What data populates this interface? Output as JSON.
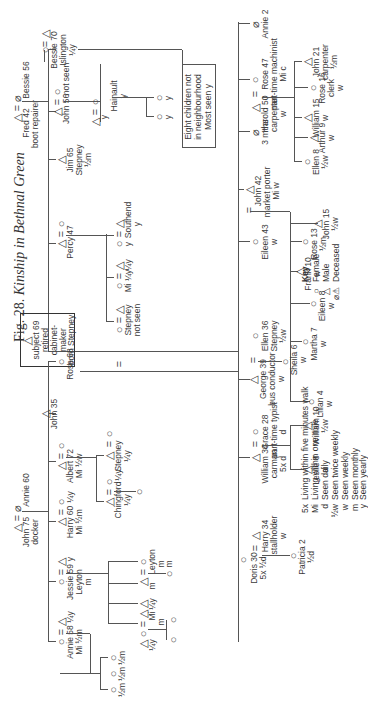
{
  "figure": {
    "label": "Fig. 28.",
    "title": "Kinship in Bethnal Green"
  },
  "symbols": {
    "female": "○",
    "male": "△",
    "deceased_female": "⌀",
    "deceased_male": "⚠",
    "marriage": "="
  },
  "left_family": {
    "parents": {
      "male": "Fred 42",
      "male_note": "boot repairer",
      "female": "Bessie 56"
    },
    "children": [
      {
        "name": "Bessie 70",
        "lines": [
          "Islington",
          "¼y"
        ],
        "sex": "F",
        "spouse": "△"
      },
      {
        "name": "John 56",
        "lines": [
          "not seen"
        ],
        "sex": "M",
        "spouse": "○"
      },
      {
        "name": "Jim 65",
        "lines": [
          "Stepney",
          "½m"
        ],
        "sex": "M"
      },
      {
        "name": "Percy 47",
        "lines": [],
        "sex": "M",
        "spouse": "○"
      }
    ],
    "grandchildren_hainault": {
      "label": "Hainault",
      "freq": "y",
      "kids": [
        "y",
        "y"
      ]
    },
    "note_box": [
      "Eight children not",
      "in neighbourhood",
      "Most seen y"
    ]
  },
  "subject": {
    "lines": [
      "subject 69",
      "retired",
      "cabinet-",
      "maker",
      "born Stepney"
    ]
  },
  "percy_children": [
    {
      "label": "Southend",
      "freq": "y"
    },
    {
      "label": "Mi ¼y",
      "freq": "¼y"
    },
    {
      "label": "Stepney",
      "freq": "not seen"
    }
  ],
  "top_family": {
    "parents": {
      "male": "John 75",
      "male_note": "docker",
      "female": "Annie 60"
    },
    "children": [
      {
        "name": "Rose 68"
      },
      {
        "name": "John 35"
      },
      {
        "name": "Albert 72",
        "lines": [
          "Mi ½w"
        ]
      },
      {
        "name": "Harry 60",
        "lines": [
          "Mi ½m"
        ],
        "spouse_note": "¼y"
      },
      {
        "name": "Jessie 59",
        "lines": [
          "Leyton",
          "m"
        ],
        "spouse_note": "y"
      },
      {
        "name": "Annie 58",
        "lines": [
          "Mi ½m"
        ],
        "spouse_note": "¼y"
      }
    ],
    "albert_children": [
      {
        "label": "Stepney",
        "freq": "¼y"
      },
      {
        "label": "Chingford",
        "freq": "¼y",
        "spouse_note": "¼y"
      }
    ],
    "annie_children": [
      "½m",
      "½m",
      "½m"
    ],
    "jessie_children": [
      {
        "label": "Leyton",
        "freq": "m",
        "child": "m"
      },
      {
        "freq": "¼y"
      },
      {
        "label": "Mi",
        "freq": "m"
      },
      {
        "freq": "¼y"
      }
    ]
  },
  "main_children": [
    {
      "name": "Annie 2",
      "deceased": true
    },
    {
      "name": "Rose 47",
      "lines": [
        "part-time machinist",
        "Mi c"
      ],
      "spouse": "Harold 50",
      "spouse_lines": [
        "carpenter",
        "w"
      ]
    },
    {
      "name": "3 mths",
      "deceased": true
    },
    {
      "name": "John 42",
      "lines": [
        "market porter",
        "Mi w"
      ]
    },
    {
      "name": "Eileen 43",
      "lines": [
        "w"
      ]
    },
    {
      "name": "Ellen 36",
      "lines": [
        "Stepney",
        "½w"
      ]
    },
    {
      "name": "George 39",
      "lines": [
        "bus conductor",
        "w"
      ]
    },
    {
      "name": "Grace 28",
      "lines": [
        "part-time typist",
        "d"
      ],
      "spouse": "William 34",
      "spouse_lines": [
        "carman",
        "5x d"
      ]
    },
    {
      "name": "Harry 34",
      "lines": [
        "stallholder",
        "w"
      ],
      "spouse": "Doris 30",
      "spouse_lines": [
        "5x ½d"
      ]
    }
  ],
  "grandchildren": {
    "rose": [
      {
        "name": "John 21",
        "lines": [
          "carpenter",
          "½m"
        ]
      },
      {
        "name": "Rose 16",
        "lines": [
          "clerk",
          "w"
        ]
      },
      {
        "name": "William 15",
        "lines": [
          "w"
        ]
      },
      {
        "name": "Arthur 9",
        "lines": [
          "w"
        ]
      },
      {
        "name": "Ellen 8",
        "lines": [
          "½w"
        ]
      }
    ],
    "john": [
      {
        "name": "John 15",
        "lines": [
          "½w"
        ]
      },
      {
        "name": "Rose 13",
        "lines": [
          "½m"
        ]
      },
      {
        "name": "Frank 10",
        "lines": [
          "w"
        ]
      },
      {
        "name": "Eileen 8",
        "lines": [
          "w"
        ]
      },
      {
        "name": "Martha 7",
        "lines": [
          "w"
        ]
      },
      {
        "name": "Lilian 4",
        "lines": [
          "w"
        ]
      }
    ],
    "george": [
      {
        "name": "Sheila 6",
        "lines": [
          "w"
        ]
      }
    ],
    "grace": [
      {
        "name": "William 10",
        "lines": [
          "½w"
        ]
      },
      {
        "name": "Leslie 8",
        "lines": [
          "d"
        ]
      }
    ],
    "harry": [
      {
        "name": "Patricia 2",
        "lines": [
          "½d"
        ]
      }
    ]
  },
  "key": {
    "heading": "Key",
    "symbols": [
      {
        "sym": "○",
        "label": "Female"
      },
      {
        "sym": "△",
        "label": "Male"
      },
      {
        "sym": "⌀⚠",
        "label": "Deceased"
      }
    ],
    "codes": [
      {
        "code": "5x",
        "label": "Living within five minutes walk"
      },
      {
        "code": "Mi",
        "label": "Living within one mile"
      },
      {
        "code": "d",
        "label": "Seen daily"
      },
      {
        "code": "½w",
        "label": "Seen twice weekly"
      },
      {
        "code": "w",
        "label": "Seen weekly"
      },
      {
        "code": "m",
        "label": "Seen monthly"
      },
      {
        "code": "y",
        "label": "Seen yearly"
      }
    ]
  }
}
